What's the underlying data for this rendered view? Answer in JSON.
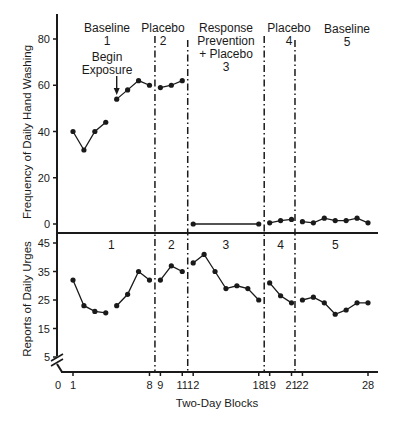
{
  "chart_data": [
    {
      "type": "line",
      "panel": "upper",
      "title": "",
      "xlabel": "Two-Day Blocks",
      "ylabel": "Frequency of Daily Hand Washing",
      "ylim": [
        0,
        80
      ],
      "yticks": [
        0,
        20,
        40,
        60,
        80
      ],
      "grid": false,
      "phases": [
        {
          "label_lines": [
            "Baseline",
            "1"
          ],
          "blocks": [
            1,
            8
          ]
        },
        {
          "label_lines": [
            "Placebo",
            "2"
          ],
          "blocks": [
            9,
            11
          ]
        },
        {
          "label_lines": [
            "Response",
            "Prevention",
            "+ Placebo",
            "3"
          ],
          "blocks": [
            12,
            18
          ]
        },
        {
          "label_lines": [
            "Placebo",
            "4"
          ],
          "blocks": [
            19,
            21
          ]
        },
        {
          "label_lines": [
            "Baseline",
            "5"
          ],
          "blocks": [
            22,
            28
          ]
        }
      ],
      "annotation": {
        "text_lines": [
          "Begin",
          "Exposure"
        ],
        "arrow_at_block": 5
      },
      "series": [
        {
          "name": "Phase 1",
          "x": [
            1,
            2,
            3,
            4
          ],
          "values": [
            40,
            32,
            40,
            44
          ]
        },
        {
          "name": "Phase 1 (exposure)",
          "x": [
            5,
            6,
            7,
            8
          ],
          "values": [
            54,
            58,
            62,
            60
          ]
        },
        {
          "name": "Phase 2",
          "x": [
            9,
            10,
            11
          ],
          "values": [
            59,
            60,
            62
          ]
        },
        {
          "name": "Phase 3",
          "x": [
            12,
            18
          ],
          "values": [
            0,
            0
          ]
        },
        {
          "name": "Phase 4",
          "x": [
            19,
            20,
            21
          ],
          "values": [
            0.5,
            1.5,
            2
          ]
        },
        {
          "name": "Phase 5",
          "x": [
            22,
            23,
            24,
            25,
            26,
            27,
            28
          ],
          "values": [
            1,
            0.5,
            2.5,
            1.5,
            1.5,
            2.5,
            0.5
          ]
        }
      ]
    },
    {
      "type": "line",
      "panel": "lower",
      "title": "",
      "xlabel": "Two-Day Blocks",
      "ylabel": "Reports of Daily Urges",
      "ylim": [
        5,
        45
      ],
      "yticks": [
        5,
        15,
        25,
        35,
        45
      ],
      "axis_break": true,
      "grid": false,
      "phases": [
        {
          "label": "1",
          "blocks": [
            1,
            8
          ]
        },
        {
          "label": "2",
          "blocks": [
            9,
            11
          ]
        },
        {
          "label": "3",
          "blocks": [
            12,
            18
          ]
        },
        {
          "label": "4",
          "blocks": [
            19,
            21
          ]
        },
        {
          "label": "5",
          "blocks": [
            22,
            28
          ]
        }
      ],
      "series": [
        {
          "name": "Phase 1a",
          "x": [
            1,
            2,
            3,
            4
          ],
          "values": [
            32,
            23,
            21,
            20.5
          ]
        },
        {
          "name": "Phase 1b",
          "x": [
            5,
            6,
            7,
            8
          ],
          "values": [
            23,
            27,
            35,
            32
          ]
        },
        {
          "name": "Phase 2",
          "x": [
            9,
            10,
            11
          ],
          "values": [
            32,
            37,
            35
          ]
        },
        {
          "name": "Phase 3",
          "x": [
            12,
            13,
            14,
            15,
            16,
            17,
            18
          ],
          "values": [
            38,
            41,
            35,
            29,
            30,
            29,
            25
          ]
        },
        {
          "name": "Phase 4",
          "x": [
            19,
            20,
            21
          ],
          "values": [
            31,
            26.5,
            24
          ]
        },
        {
          "name": "Phase 5",
          "x": [
            22,
            23,
            24,
            25,
            26,
            27,
            28
          ],
          "values": [
            25,
            26,
            24,
            20,
            21.5,
            24,
            24
          ]
        }
      ]
    }
  ],
  "x_axis": {
    "label": "Two-Day Blocks",
    "ticks": [
      0,
      1,
      8,
      9,
      11,
      12,
      18,
      19,
      21,
      22,
      28
    ]
  },
  "phase_change_lines_after_block": [
    8,
    11,
    18,
    21
  ]
}
